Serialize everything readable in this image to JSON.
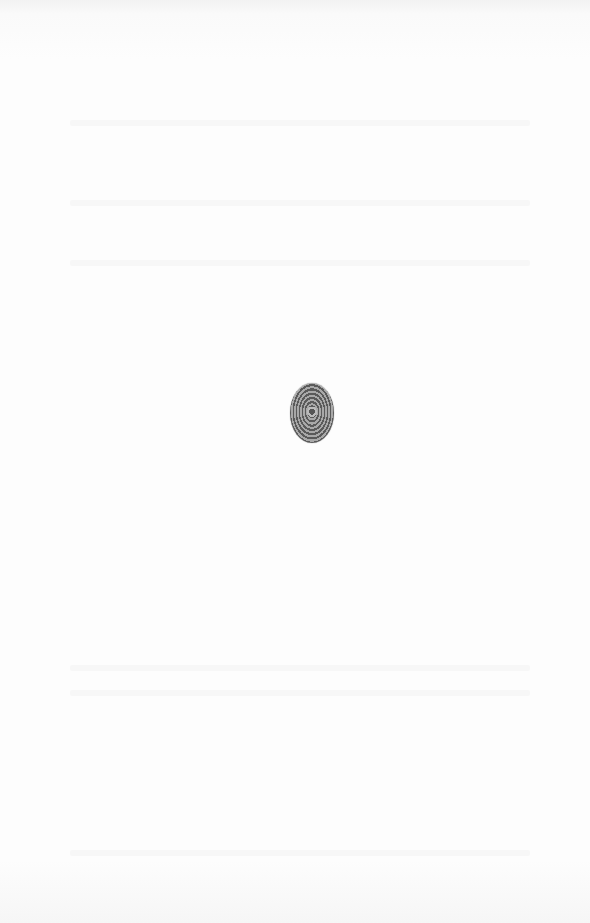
{
  "page": {
    "type": "blank scanned page",
    "background_color": "#fbfbfb"
  },
  "ornament": {
    "icon": "fingerprint-rosette-ornament-icon",
    "color": "#5a5a5a",
    "position": "center"
  }
}
